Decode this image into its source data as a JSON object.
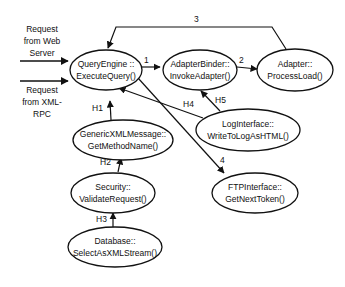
{
  "inputs": [
    {
      "label_lines": [
        "Request",
        "from Web",
        "Server"
      ]
    },
    {
      "label_lines": [
        "Request",
        "from XML-",
        "RPC"
      ]
    }
  ],
  "nodes": {
    "query_engine": {
      "line1": "QueryEngine ::",
      "line2": "ExecuteQuery()"
    },
    "adapter_binder": {
      "line1": "AdapterBinder::",
      "line2": "InvokeAdapter()"
    },
    "adapter": {
      "line1": "Adapter::",
      "line2": "ProcessLoad()"
    },
    "generic_xml": {
      "line1": "GenericXMLMessage::",
      "line2": "GetMethodName()"
    },
    "log_interface": {
      "line1": "LogInterface::",
      "line2": "WriteToLogAsHTML()"
    },
    "security": {
      "line1": "Security::",
      "line2": "ValidateRequest()"
    },
    "ftp_interface": {
      "line1": "FTPInterface::",
      "line2": "GetNextToken()"
    },
    "database": {
      "line1": "Database::",
      "line2": "SelectAsXMLStream()"
    }
  },
  "edges": {
    "e1": "1",
    "e2": "2",
    "e3": "3",
    "e4": "4",
    "h1": "H1",
    "h2": "H2",
    "h3": "H3",
    "h4": "H4",
    "h5": "H5"
  }
}
